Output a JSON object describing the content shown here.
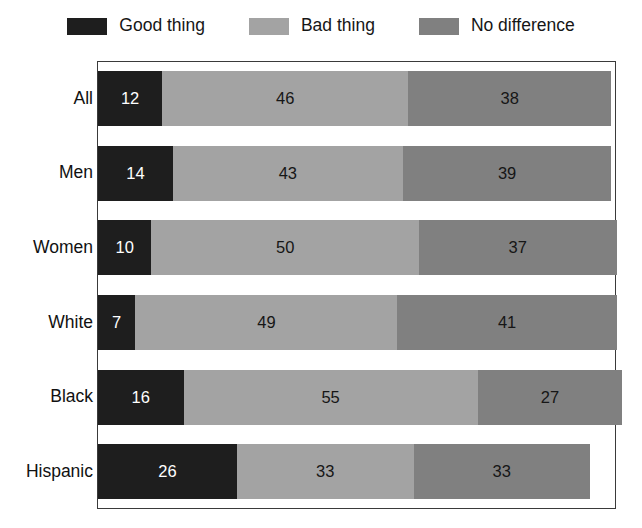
{
  "legend": {
    "items": [
      {
        "label": "Good thing",
        "color": "#1e1e1e",
        "key": "good"
      },
      {
        "label": "Bad thing",
        "color": "#a3a3a3",
        "key": "bad"
      },
      {
        "label": "No difference",
        "color": "#808080",
        "key": "nodiff"
      }
    ]
  },
  "chart_data": {
    "type": "bar",
    "orientation": "horizontal",
    "stacked": true,
    "title": "",
    "subtitle": "",
    "xlabel": "",
    "ylabel": "",
    "xlim": [
      0,
      100
    ],
    "grid": false,
    "legend_position": "top",
    "categories": [
      "All",
      "Men",
      "Women",
      "White",
      "Black",
      "Hispanic"
    ],
    "series": [
      {
        "name": "Good thing",
        "color": "#1e1e1e",
        "values": [
          12,
          14,
          10,
          7,
          16,
          26
        ]
      },
      {
        "name": "Bad thing",
        "color": "#a3a3a3",
        "values": [
          46,
          43,
          50,
          49,
          55,
          33
        ]
      },
      {
        "name": "No difference",
        "color": "#808080",
        "values": [
          38,
          39,
          37,
          41,
          27,
          33
        ]
      }
    ],
    "rows": [
      {
        "label": "All",
        "good": 12,
        "bad": 46,
        "nodiff": 38
      },
      {
        "label": "Men",
        "good": 14,
        "bad": 43,
        "nodiff": 39
      },
      {
        "label": "Women",
        "good": 10,
        "bad": 50,
        "nodiff": 37
      },
      {
        "label": "White",
        "good": 7,
        "bad": 49,
        "nodiff": 41
      },
      {
        "label": "Black",
        "good": 16,
        "bad": 55,
        "nodiff": 27
      },
      {
        "label": "Hispanic",
        "good": 26,
        "bad": 33,
        "nodiff": 33
      }
    ]
  }
}
